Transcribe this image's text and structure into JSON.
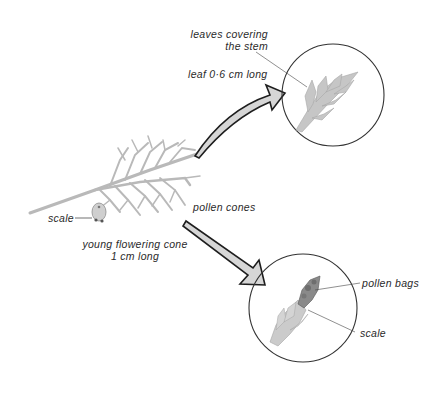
{
  "labels": {
    "leaves_covering_line1": "leaves covering",
    "leaves_covering_line2": "the stem",
    "leaf_length": "leaf 0·6 cm long",
    "pollen_cones": "pollen cones",
    "scale_main": "scale",
    "young_cone_line1": "young flowering cone",
    "young_cone_line2": "1 cm long",
    "pollen_bags": "pollen bags",
    "scale_detail": "scale"
  },
  "colors": {
    "ink": "#2a2a2a",
    "arrow_fill": "#d6d6d6",
    "branch": "#b9b9b9",
    "foliage": "#c4c4c4",
    "pollen_bags": "#8a8a8a",
    "circle_stroke": "#333333"
  },
  "icons": {
    "top_arrow": "curved-arrow-icon",
    "bottom_arrow": "straight-arrow-icon"
  }
}
